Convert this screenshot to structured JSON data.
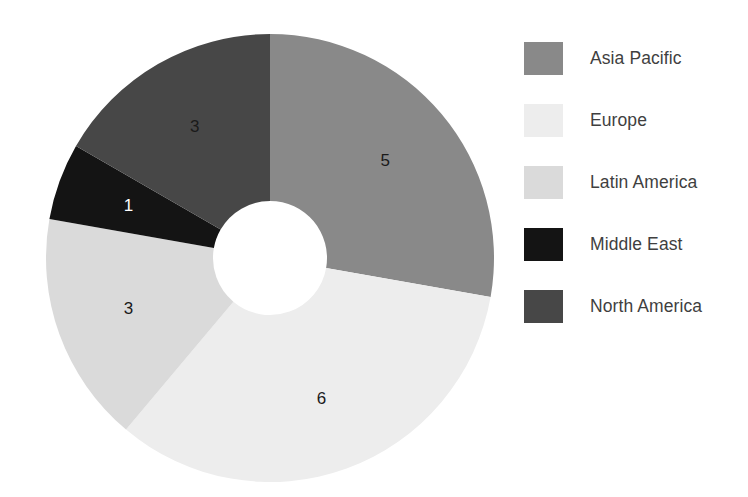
{
  "chart_data": {
    "type": "pie",
    "variant": "donut",
    "title": "",
    "subtitle": "",
    "xlabel": "",
    "ylabel": "",
    "categories": [
      "Asia Pacific",
      "Europe",
      "Latin America",
      "Middle East",
      "North America"
    ],
    "values": [
      5,
      6,
      3,
      1,
      3
    ],
    "value_labels": [
      "5",
      "6",
      "3",
      "1",
      "3"
    ],
    "total": 18,
    "colors": [
      "#898989",
      "#ededed",
      "#dadada",
      "#141414",
      "#474747"
    ],
    "label_text_colors": [
      "#1a1a1a",
      "#1a1a1a",
      "#1a1a1a",
      "#ffffff",
      "#1a1a1a"
    ],
    "start_angle_deg": 0,
    "direction": "clockwise",
    "inner_radius_ratio": 0.255,
    "grid": false,
    "legend": {
      "position": "right",
      "entries": [
        {
          "label": "Asia Pacific",
          "color": "#898989",
          "value": 5
        },
        {
          "label": "Europe",
          "color": "#ededed",
          "value": 6
        },
        {
          "label": "Latin America",
          "color": "#dadada",
          "value": 3
        },
        {
          "label": "Middle East",
          "color": "#141414",
          "value": 1
        },
        {
          "label": "North America",
          "color": "#474747",
          "value": 3
        }
      ]
    }
  },
  "figure": {
    "background": "#ffffff",
    "center_x": 270,
    "center_y": 258,
    "outer_radius": 224,
    "inner_radius": 57
  }
}
